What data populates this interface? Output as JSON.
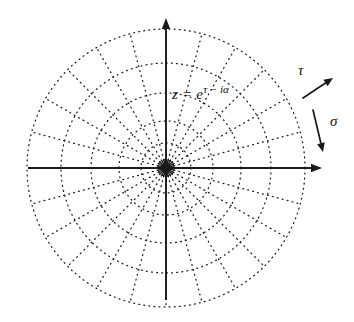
{
  "figure": {
    "background_color": "#ffffff",
    "ink_color": "#1a1a1a",
    "width": 354,
    "height": 322
  },
  "labels": {
    "formula_base": "z = e",
    "formula_exponent": "τ − iα",
    "tau": "τ",
    "sigma": "σ"
  },
  "chart_data": {
    "type": "line",
    "subtype": "polar-grid",
    "xlabel": "",
    "ylabel": "",
    "grid": true,
    "legend": false,
    "center": {
      "x": 166,
      "y": 168
    },
    "axes": {
      "horizontal": {
        "x1": 28,
        "y1": 168,
        "x2": 322,
        "y2": 168,
        "arrow": "right"
      },
      "vertical": {
        "x1": 166,
        "y1": 300,
        "x2": 166,
        "y2": 18,
        "arrow": "up"
      },
      "style": "solid"
    },
    "circles": {
      "description": "concentric dotted circles of geometrically increasing radius (constant τ curves)",
      "radii": [
        8,
        25,
        47,
        75,
        105,
        139
      ],
      "ratio": 1.3,
      "style": "dotted"
    },
    "spokes": {
      "description": "radial dotted lines at constant angle (constant α curves)",
      "angle_step_degrees": 15,
      "count": 24,
      "outer_radius": 139,
      "style": "dotted"
    },
    "annotations": [
      {
        "text": "z = e^(τ − iα)",
        "x": 172,
        "y": 92,
        "role": "map-formula"
      },
      {
        "text": "τ",
        "x": 298,
        "y": 70,
        "role": "tau-direction",
        "arrow": {
          "x1": 303,
          "y1": 98,
          "x2": 333,
          "y2": 78,
          "direction": "outward-radial"
        }
      },
      {
        "text": "σ",
        "x": 330,
        "y": 121,
        "role": "sigma-direction",
        "arrow": {
          "x1": 313,
          "y1": 110,
          "x2": 323,
          "y2": 152,
          "direction": "downward-tangential"
        }
      }
    ]
  }
}
